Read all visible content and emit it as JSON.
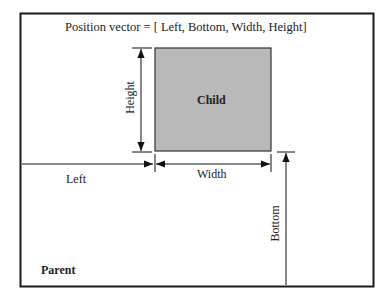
{
  "title": "Position vector = [ Left, Bottom, Width, Height]",
  "parent": {
    "label": "Parent",
    "border_color": "#1a1a1a"
  },
  "child": {
    "label": "Child",
    "fill_color": "#b9b9b9",
    "border_color": "#333333"
  },
  "dimensions": {
    "left": "Left",
    "bottom": "Bottom",
    "width": "Width",
    "height": "Height"
  }
}
